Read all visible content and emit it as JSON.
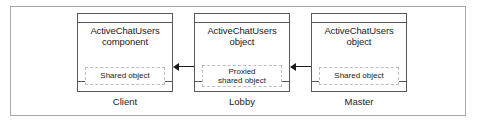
{
  "diagram": {
    "nodes": [
      {
        "title_line1": "ActiveChatUsers",
        "title_line2": "component",
        "inner_line1": "Shared object",
        "inner_line2": "",
        "caption": "Client"
      },
      {
        "title_line1": "ActiveChatUsers",
        "title_line2": "object",
        "inner_line1": "Proxied",
        "inner_line2": "shared object",
        "caption": "Lobby"
      },
      {
        "title_line1": "ActiveChatUsers",
        "title_line2": "object",
        "inner_line1": "Shared object",
        "inner_line2": "",
        "caption": "Master"
      }
    ],
    "connectors": [
      {
        "name": "client-lobby-link",
        "kind": "bidirectional-arrow"
      },
      {
        "name": "lobby-master-link",
        "kind": "bidirectional-arrow"
      }
    ],
    "colors": {
      "frame": "#a8a8a8",
      "node_border": "#58585a",
      "dashed_border": "#bdbdbd",
      "arrow": "#1a1a1a",
      "text": "#1a1a1a",
      "background": "#ffffff"
    }
  }
}
